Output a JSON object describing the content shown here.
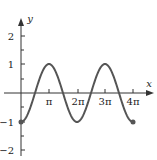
{
  "chart_data": {
    "type": "line",
    "title": "",
    "function": "y = -cos(x)",
    "xlabel": "x",
    "ylabel": "y",
    "xlim": [
      0,
      12.566
    ],
    "ylim": [
      -2,
      2
    ],
    "x_ticks": [
      "π",
      "2π",
      "3π",
      "4π"
    ],
    "y_ticks": [
      "2",
      "1",
      "-1",
      "-2"
    ],
    "grid": false,
    "endpoints": [
      {
        "x": 0,
        "y": -1
      },
      {
        "x": 12.566,
        "y": -1
      }
    ],
    "series": [
      {
        "name": "-cos(x)",
        "x": [
          0,
          1.5708,
          3.1416,
          4.7124,
          6.2832,
          7.854,
          9.4248,
          10.9956,
          12.5664
        ],
        "values": [
          -1,
          0,
          1,
          0,
          -1,
          0,
          1,
          0,
          -1
        ]
      }
    ],
    "colors": {
      "curve": "#555555",
      "axes": "#333333"
    }
  },
  "labels": {
    "x_axis": "x",
    "y_axis": "y",
    "xt1": "π",
    "xt2": "2π",
    "xt3": "3π",
    "xt4": "4π",
    "yt2": "2",
    "yt1": "1",
    "ytm1": "−1",
    "ytm2": "−2"
  }
}
